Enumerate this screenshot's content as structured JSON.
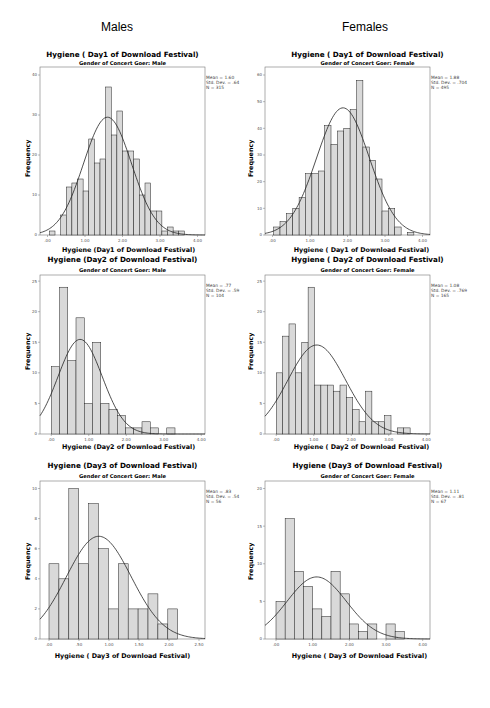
{
  "columns": {
    "left": "Males",
    "right": "Females"
  },
  "chart_data": [
    {
      "id": "male_day1",
      "type": "bar",
      "title": "Hygiene ( Day1 of Download Festival)",
      "subtitle": "Gender of Concert Goer: Male",
      "xlabel": "Hygiene (Day1 of Download Festival)",
      "ylabel": "Frequency",
      "xlim": [
        -0.2,
        4.2
      ],
      "ylim": [
        0,
        42
      ],
      "xticks": [
        0,
        1,
        2,
        3,
        4
      ],
      "xtick_labels": [
        ".00",
        "1.00",
        "2.00",
        "3.00",
        "4.00"
      ],
      "yticks": [
        0,
        10,
        20,
        30,
        40
      ],
      "bin_width": 0.15,
      "bin_starts": [
        0.05,
        0.2,
        0.35,
        0.5,
        0.65,
        0.8,
        0.95,
        1.1,
        1.25,
        1.4,
        1.55,
        1.7,
        1.85,
        2.0,
        2.15,
        2.3,
        2.45,
        2.6,
        2.75,
        2.9,
        3.05,
        3.2,
        3.35,
        3.5
      ],
      "values": [
        1,
        0,
        5,
        12,
        13,
        14,
        11,
        24,
        18,
        19,
        37,
        25,
        31,
        21,
        21,
        19,
        10,
        13,
        6,
        6,
        1,
        2,
        1,
        1
      ],
      "stats": {
        "mean": "Mean = 1.60",
        "sd": "Std. Dev. = .64",
        "n": "N = 315"
      },
      "normal_curve": {
        "mean": 1.6,
        "sd": 0.64,
        "n": 315
      },
      "grid": false,
      "legend": "none"
    },
    {
      "id": "female_day1",
      "type": "bar",
      "title": "Hygiene ( Day1 of Download Festival)",
      "subtitle": "Gender of Concert Goer: Female",
      "xlabel": "Hygiene ( Day1 of Download Festival)",
      "ylabel": "Frequency",
      "xlim": [
        -0.2,
        4.2
      ],
      "ylim": [
        0,
        63
      ],
      "xticks": [
        0,
        1,
        2,
        3,
        4
      ],
      "xtick_labels": [
        ".00",
        "1.00",
        "2.00",
        "3.00",
        "4.00"
      ],
      "yticks": [
        0,
        10,
        20,
        30,
        40,
        50,
        60
      ],
      "bin_width": 0.17,
      "bin_starts": [
        0.03,
        0.2,
        0.37,
        0.54,
        0.71,
        0.88,
        1.05,
        1.22,
        1.39,
        1.56,
        1.73,
        1.9,
        2.07,
        2.24,
        2.41,
        2.58,
        2.75,
        2.92,
        3.09,
        3.26,
        3.43,
        3.6,
        3.77
      ],
      "values": [
        3,
        5,
        8,
        10,
        14,
        23,
        23,
        24,
        41,
        34,
        39,
        40,
        47,
        58,
        33,
        28,
        21,
        9,
        10,
        3,
        0,
        1,
        0
      ],
      "stats": {
        "mean": "Mean = 1.88",
        "sd": "Std. Dev. = .704",
        "n": "N = 495"
      },
      "normal_curve": {
        "mean": 1.88,
        "sd": 0.704,
        "n": 495
      },
      "grid": false,
      "legend": "none"
    },
    {
      "id": "male_day2",
      "type": "bar",
      "title": "Hygiene (Day2 of Download Festival)",
      "subtitle": "Gender of Concert Goer: Male",
      "xlabel": "Hygiene (Day2 of Download Festival)",
      "ylabel": "Frequency",
      "xlim": [
        -0.3,
        4.1
      ],
      "ylim": [
        0,
        26
      ],
      "xticks": [
        0,
        1,
        2,
        3,
        4
      ],
      "xtick_labels": [
        ".00",
        "1.00",
        "2.00",
        "3.00",
        "4.00"
      ],
      "yticks": [
        0,
        5,
        10,
        15,
        20,
        25
      ],
      "bin_width": 0.22,
      "bin_starts": [
        0.0,
        0.22,
        0.44,
        0.66,
        0.88,
        1.1,
        1.32,
        1.54,
        1.76,
        1.98,
        2.2,
        2.42,
        2.64,
        2.86,
        3.08
      ],
      "values": [
        11,
        24,
        12,
        19,
        5,
        15,
        5,
        4,
        3,
        1,
        1,
        2,
        1,
        0,
        1
      ],
      "stats": {
        "mean": "Mean = .77",
        "sd": "Std. Dev. = .59",
        "n": "N = 104"
      },
      "normal_curve": {
        "mean": 0.77,
        "sd": 0.59,
        "n": 104
      },
      "grid": false,
      "legend": "none"
    },
    {
      "id": "female_day2",
      "type": "bar",
      "title": "Hygiene ( Day2 of Download Festival)",
      "subtitle": "Gender of Concert Goer: Female",
      "xlabel": "Hygiene ( Day2 of Download Festival)",
      "ylabel": "Frequency",
      "xlim": [
        -0.3,
        4.1
      ],
      "ylim": [
        0,
        26
      ],
      "xticks": [
        0,
        1,
        2,
        3,
        4
      ],
      "xtick_labels": [
        ".00",
        "1.00",
        "2.00",
        "3.00",
        "4.00"
      ],
      "yticks": [
        0,
        5,
        10,
        15,
        20,
        25
      ],
      "bin_width": 0.17,
      "bin_starts": [
        0.0,
        0.17,
        0.34,
        0.51,
        0.68,
        0.85,
        1.02,
        1.19,
        1.36,
        1.53,
        1.7,
        1.87,
        2.04,
        2.21,
        2.38,
        2.55,
        2.72,
        2.89,
        3.06,
        3.23,
        3.4
      ],
      "values": [
        10,
        16,
        18,
        10,
        15,
        24,
        8,
        8,
        8,
        7,
        8,
        6,
        4,
        2,
        7,
        2,
        2,
        3,
        0,
        1,
        1
      ],
      "stats": {
        "mean": "Mean = 1.08",
        "sd": "Std. Dev. = .769",
        "n": "N = 165"
      },
      "normal_curve": {
        "mean": 1.08,
        "sd": 0.769,
        "n": 165
      },
      "grid": false,
      "legend": "none"
    },
    {
      "id": "male_day3",
      "type": "bar",
      "title": "Hygiene (Day3 of Download Festival)",
      "subtitle": "Gender of Concert Goer: Male",
      "xlabel": "Hygiene ( Day3 of Download Festival)",
      "ylabel": "Frequency",
      "xlim": [
        -0.15,
        2.6
      ],
      "ylim": [
        0,
        10.5
      ],
      "xticks": [
        0,
        0.5,
        1.0,
        1.5,
        2.0,
        2.5
      ],
      "xtick_labels": [
        ".00",
        ".50",
        "1.00",
        "1.50",
        "2.00",
        "2.50"
      ],
      "yticks": [
        0,
        2,
        4,
        6,
        8,
        10
      ],
      "bin_width": 0.165,
      "bin_starts": [
        0.0,
        0.165,
        0.33,
        0.495,
        0.66,
        0.825,
        0.99,
        1.155,
        1.32,
        1.485,
        1.65,
        1.815,
        1.98
      ],
      "values": [
        5,
        4,
        10,
        5,
        9,
        6,
        2,
        5,
        2,
        2,
        3,
        1,
        2
      ],
      "stats": {
        "mean": "Mean = .83",
        "sd": "Std. Dev. = .54",
        "n": "N = 56"
      },
      "normal_curve": {
        "mean": 0.83,
        "sd": 0.54,
        "n": 56
      },
      "grid": false,
      "legend": "none"
    },
    {
      "id": "female_day3",
      "type": "bar",
      "title": "Hygiene (Day3 of Download Festival)",
      "subtitle": "Gender of Concert Goer: Female",
      "xlabel": "Hygiene ( Day3 of Download Festival)",
      "ylabel": "Frequency",
      "xlim": [
        -0.3,
        4.2
      ],
      "ylim": [
        0,
        21
      ],
      "xticks": [
        0,
        1,
        2,
        3,
        4
      ],
      "xtick_labels": [
        ".00",
        "1.00",
        "2.00",
        "3.00",
        "4.00"
      ],
      "yticks": [
        0,
        5,
        10,
        15,
        20
      ],
      "bin_width": 0.25,
      "bin_starts": [
        0.0,
        0.25,
        0.5,
        0.75,
        1.0,
        1.25,
        1.5,
        1.75,
        2.0,
        2.25,
        2.5,
        2.75,
        3.0,
        3.25
      ],
      "values": [
        5,
        16,
        9,
        7,
        4,
        3,
        9,
        6,
        2,
        1,
        2,
        0,
        2,
        1
      ],
      "stats": {
        "mean": "Mean = 1.11",
        "sd": "Std. Dev. = .81",
        "n": "N = 67"
      },
      "normal_curve": {
        "mean": 1.11,
        "sd": 0.81,
        "n": 67
      },
      "grid": false,
      "legend": "none"
    }
  ],
  "colors": {
    "bar_fill": "#d9d9d9",
    "bar_stroke": "#222222",
    "curve": "#222222",
    "frame": "#777777"
  }
}
